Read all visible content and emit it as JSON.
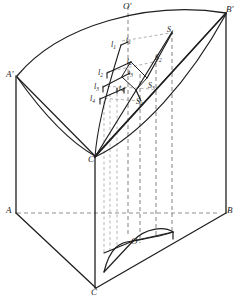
{
  "figure": {
    "stroke_color": "#1f1f1f",
    "dash_color": "#8a8a8a",
    "background": "#ffffff",
    "vertices": [
      {
        "id": "A-prime",
        "text": "A",
        "prime": "′",
        "x": 6,
        "y": 70,
        "size": "main"
      },
      {
        "id": "B-prime",
        "text": "B",
        "prime": "′",
        "x": 226,
        "y": 5,
        "size": "main"
      },
      {
        "id": "O-prime",
        "text": "O",
        "prime": "′",
        "x": 123,
        "y": 2,
        "size": "main"
      },
      {
        "id": "C-prime",
        "text": "C",
        "prime": "′",
        "x": 88,
        "y": 155,
        "size": "main"
      },
      {
        "id": "A",
        "text": "A",
        "prime": "",
        "x": 6,
        "y": 206,
        "size": "main"
      },
      {
        "id": "B",
        "text": "B",
        "prime": "",
        "x": 227,
        "y": 206,
        "size": "main"
      },
      {
        "id": "O",
        "text": "O",
        "prime": "",
        "x": 131,
        "y": 237,
        "size": "main"
      },
      {
        "id": "C",
        "text": "C",
        "prime": "",
        "x": 91,
        "y": 288,
        "size": "main"
      }
    ],
    "l_labels": [
      {
        "id": "l1",
        "base": "l",
        "index": "1",
        "x": 111,
        "y": 41
      },
      {
        "id": "l2",
        "base": "l",
        "index": "2",
        "x": 98,
        "y": 69
      },
      {
        "id": "l3",
        "base": "l",
        "index": "3",
        "x": 94,
        "y": 83
      },
      {
        "id": "l4",
        "base": "l",
        "index": "4",
        "x": 90,
        "y": 95
      }
    ],
    "t_labels": [
      {
        "id": "t1",
        "base": "t",
        "index": "1",
        "x": 126,
        "y": 36
      },
      {
        "id": "t2",
        "base": "t",
        "index": "2",
        "x": 127,
        "y": 57
      },
      {
        "id": "t3",
        "base": "t",
        "index": "3",
        "x": 128,
        "y": 69
      },
      {
        "id": "t4",
        "base": "t",
        "index": "4",
        "x": 119,
        "y": 84
      }
    ],
    "s_labels": [
      {
        "id": "S1",
        "base": "S",
        "index": "1",
        "x": 167,
        "y": 26
      },
      {
        "id": "S2",
        "base": "S",
        "index": "2",
        "x": 155,
        "y": 54
      },
      {
        "id": "S3",
        "base": "S",
        "index": "3",
        "x": 148,
        "y": 82
      },
      {
        "id": "S4",
        "base": "S",
        "index": "4",
        "x": 136,
        "y": 98
      }
    ]
  }
}
